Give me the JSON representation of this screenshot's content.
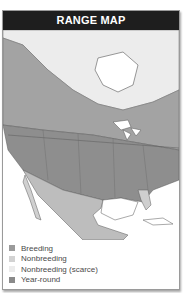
{
  "header": {
    "title": "RANGE MAP"
  },
  "legend": {
    "items": [
      {
        "label": "Breeding",
        "color": "#9a9a9a"
      },
      {
        "label": "Nonbreeding",
        "color": "#d2d2d2"
      },
      {
        "label": "Nonbreeding (scarce)",
        "color": "#ececec"
      },
      {
        "label": "Year-round",
        "color": "#8a8a8a"
      }
    ]
  },
  "map": {
    "colors": {
      "ocean": "#ffffff",
      "breeding": "#a3a3a3",
      "yearround": "#8e8e8e",
      "nonbreeding": "#cfcfcf",
      "scarce": "#ebebeb",
      "border": "#5a5a5a"
    }
  }
}
